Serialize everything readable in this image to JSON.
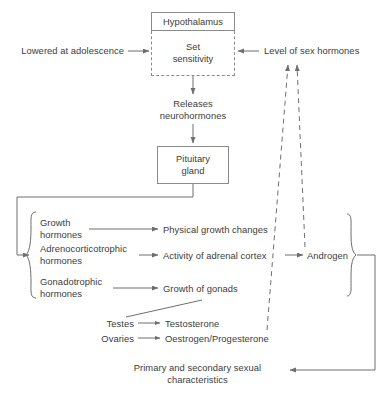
{
  "diagram": {
    "stroke_color": "#6e6e6e",
    "text_color": "#3c3c3c",
    "nodes": {
      "hypothalamus": "Hypothalamus",
      "set_sensitivity": "Set\nsensitivity",
      "lowered_at_adolescence": "Lowered at adolescence",
      "level_of_sex_hormones": "Level of sex hormones",
      "releases_neurohormones": "Releases\nneurohormones",
      "pituitary_gland": "Pituitary\ngland",
      "growth_hormones": "Growth\nhormones",
      "adrenocorticotrophic_hormones": "Adrenocorticotrophic\nhormones",
      "gonadotrophic_hormones": "Gonadotrophic\nhormones",
      "physical_growth_changes": "Physical growth changes",
      "activity_of_adrenal_cortex": "Activity of adrenal cortex",
      "growth_of_gonads": "Growth of gonads",
      "androgen": "Androgen",
      "testes": "Testes",
      "ovaries": "Ovaries",
      "testosterone": "Testosterone",
      "oestrogen_progesterone": "Oestrogen/Progesterone",
      "primary_secondary_characteristics": "Primary and secondary sexual\ncharacteristics"
    },
    "edges": [
      {
        "name": "lowered-to-set-sensitivity",
        "style": "solid",
        "arrow": "end"
      },
      {
        "name": "sex-hormones-to-set-sensitivity",
        "style": "solid",
        "arrow": "end"
      },
      {
        "name": "hypothalamus-to-releases",
        "style": "solid",
        "arrow": "end"
      },
      {
        "name": "releases-to-pituitary",
        "style": "solid",
        "arrow": "end"
      },
      {
        "name": "pituitary-to-hormone-group",
        "style": "solid",
        "arrow": "end"
      },
      {
        "name": "growth-hormones-to-physical-growth",
        "style": "solid",
        "arrow": "end"
      },
      {
        "name": "adrenocorticotrophic-to-adrenal-cortex",
        "style": "solid",
        "arrow": "end"
      },
      {
        "name": "gonadotrophic-to-growth-of-gonads",
        "style": "solid",
        "arrow": "end"
      },
      {
        "name": "adrenal-cortex-to-androgen",
        "style": "solid",
        "arrow": "end"
      },
      {
        "name": "gonads-to-testes",
        "style": "solid",
        "arrow": "none"
      },
      {
        "name": "testes-to-testosterone",
        "style": "solid",
        "arrow": "end"
      },
      {
        "name": "ovaries-to-oestrogen",
        "style": "solid",
        "arrow": "end"
      },
      {
        "name": "androgen-feedback-to-sex-hormones",
        "style": "dashed",
        "arrow": "end"
      },
      {
        "name": "oestrogen-feedback-to-sex-hormones",
        "style": "dashed",
        "arrow": "end"
      },
      {
        "name": "bracket-to-primary-secondary",
        "style": "solid",
        "arrow": "end"
      }
    ]
  }
}
